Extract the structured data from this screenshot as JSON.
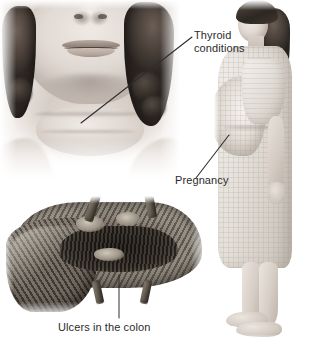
{
  "figure": {
    "width": 321,
    "height": 341,
    "background_color": "#ffffff",
    "text_color": "#2b2b2b",
    "leader_line_color": "#2e2e2e"
  },
  "panels": [
    {
      "id": "neck",
      "name": "thyroid-neck-illustration",
      "caption": "Close-up frontal view of a woman's lower face and enlarged neck showing thyroid swelling"
    },
    {
      "id": "colon",
      "name": "colon-illustration",
      "caption": "Opened segment of large intestine showing ulcerated mucosa"
    },
    {
      "id": "woman",
      "name": "pregnant-woman-illustration",
      "caption": "Side profile of a standing pregnant woman in a gown"
    }
  ],
  "labels": {
    "thyroid": {
      "line1": "Thyroid",
      "line2": "conditions"
    },
    "pregnancy": {
      "text": "Pregnancy"
    },
    "colon": {
      "text": "Ulcers in the colon"
    }
  },
  "leaders": [
    {
      "name": "thyroid-leader-line",
      "from_x": 81,
      "from_y": 123,
      "to_x": 192,
      "to_y": 37
    },
    {
      "name": "pregnancy-leader-line",
      "from_x": 196,
      "from_y": 178,
      "to_x": 229,
      "to_y": 135
    },
    {
      "name": "colon-leader-line",
      "from_x": 119,
      "from_y": 275,
      "to_x": 119,
      "to_y": 318
    }
  ]
}
